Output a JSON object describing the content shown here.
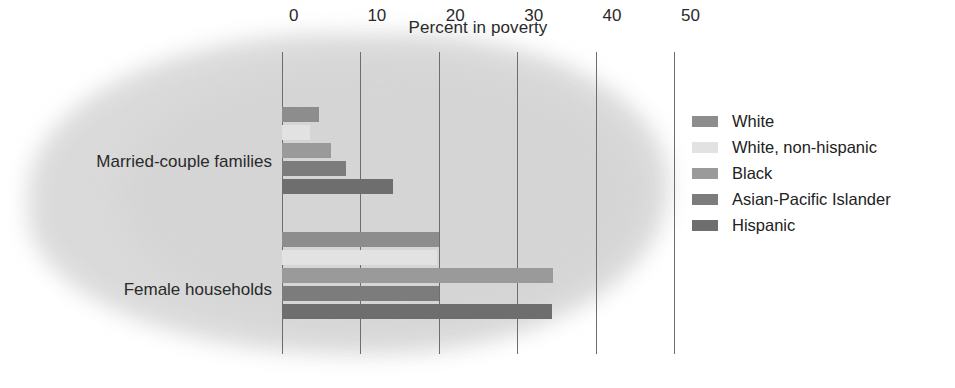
{
  "chart_data": {
    "type": "bar",
    "title": "Percent in poverty",
    "xlabel": "",
    "ylabel": "",
    "orientation": "horizontal",
    "grid": true,
    "legend_position": "right",
    "xlim": [
      0,
      50
    ],
    "xticks": [
      "0",
      "10",
      "20",
      "30",
      "40",
      "50"
    ],
    "categories": [
      "Married-couple families",
      "Female households"
    ],
    "series": [
      {
        "name": "White",
        "color": "#8d8d8d",
        "values": [
          4.7,
          20.0
        ]
      },
      {
        "name": "White, non-hispanic",
        "color": "#e2e2e2",
        "values": [
          3.6,
          19.8
        ]
      },
      {
        "name": "Black",
        "color": "#9a9a9a",
        "values": [
          6.2,
          34.6
        ]
      },
      {
        "name": "Asian-Pacific Islander",
        "color": "#7c7c7c",
        "values": [
          8.1,
          20.0
        ]
      },
      {
        "name": "Hispanic",
        "color": "#6e6e6e",
        "values": [
          14.2,
          34.5
        ]
      }
    ]
  },
  "legend": {
    "items": [
      {
        "label": "White"
      },
      {
        "label": "White, non-hispanic"
      },
      {
        "label": "Black"
      },
      {
        "label": "Asian-Pacific Islander"
      },
      {
        "label": "Hispanic"
      }
    ]
  },
  "axis": {
    "tick0": "0",
    "tick1": "10",
    "tick2": "20",
    "tick3": "30",
    "tick4": "40",
    "tick5": "50"
  },
  "labels": {
    "group1": "Married-couple families",
    "group2": "Female households"
  },
  "colors": {
    "background": "#ffffff",
    "blob": "#d9d9d9",
    "gridline": "#6d6d6d",
    "text": "#2a2a2a"
  }
}
